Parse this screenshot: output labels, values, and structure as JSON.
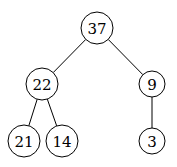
{
  "diagram": {
    "type": "binary-tree",
    "nodes": [
      {
        "id": "n37",
        "label": "37",
        "x": 97,
        "y": 28,
        "r": 16
      },
      {
        "id": "n22",
        "label": "22",
        "x": 42,
        "y": 84,
        "r": 16
      },
      {
        "id": "n9",
        "label": "9",
        "x": 152,
        "y": 84,
        "r": 13
      },
      {
        "id": "n21",
        "label": "21",
        "x": 24,
        "y": 141,
        "r": 16
      },
      {
        "id": "n14",
        "label": "14",
        "x": 62,
        "y": 141,
        "r": 16
      },
      {
        "id": "n3",
        "label": "3",
        "x": 152,
        "y": 141,
        "r": 13
      }
    ],
    "edges": [
      {
        "from": "n37",
        "to": "n22"
      },
      {
        "from": "n37",
        "to": "n9"
      },
      {
        "from": "n22",
        "to": "n21"
      },
      {
        "from": "n22",
        "to": "n14"
      },
      {
        "from": "n9",
        "to": "n3"
      }
    ]
  }
}
